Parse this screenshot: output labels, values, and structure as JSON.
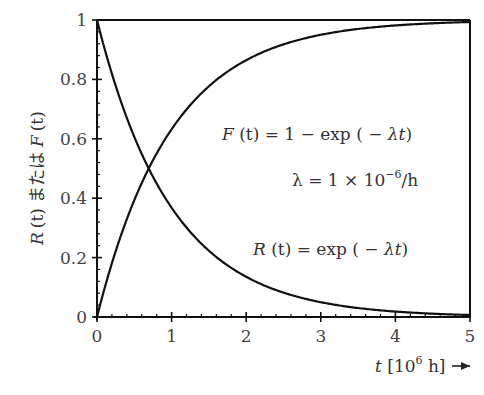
{
  "chart_data": {
    "type": "line",
    "title": "",
    "xlabel": "t [10^6 h] →",
    "xlabel_parts": {
      "var": "t",
      "open": " [10",
      "sup": "6",
      "close": " h]"
    },
    "ylabel": "R (t) または F (t)",
    "ylabel_parts": {
      "r": "R",
      "t1": "(t)",
      "mid": "または",
      "f": "F",
      "t2": "(t)"
    },
    "xlim": [
      0,
      5
    ],
    "ylim": [
      0,
      1
    ],
    "x_ticks": [
      "0",
      "1",
      "2",
      "3",
      "4",
      "5"
    ],
    "y_ticks": [
      "0",
      "0.2",
      "0.4",
      "0.6",
      "0.8",
      "1"
    ],
    "grid": false,
    "lambda_per_1e6h": 1,
    "series": [
      {
        "name": "F(t) = 1 − exp(−λt)",
        "x": [
          0,
          0.5,
          0.693,
          1,
          1.5,
          2,
          2.5,
          3,
          3.5,
          4,
          4.5,
          5
        ],
        "values": [
          0,
          0.393,
          0.5,
          0.632,
          0.777,
          0.865,
          0.918,
          0.95,
          0.97,
          0.982,
          0.989,
          0.993
        ]
      },
      {
        "name": "R(t) = exp(−λt)",
        "x": [
          0,
          0.5,
          0.693,
          1,
          1.5,
          2,
          2.5,
          3,
          3.5,
          4,
          4.5,
          5
        ],
        "values": [
          1,
          0.607,
          0.5,
          0.368,
          0.223,
          0.135,
          0.082,
          0.05,
          0.03,
          0.018,
          0.011,
          0.007
        ]
      }
    ],
    "annotations": [
      {
        "id": "F",
        "text": "F (t) = 1 − exp ( − λt)"
      },
      {
        "id": "lambda",
        "text": "λ = 1 × 10^−6/h"
      },
      {
        "id": "R",
        "text": "R (t) = exp ( − λt)"
      }
    ]
  },
  "annotations": {
    "f_lhs": "F",
    "f_t": " (t) = 1 − exp ( − ",
    "f_lt": "λt",
    "f_close": ")",
    "lam": "λ",
    "lam_rest": " = 1 × 10",
    "lam_sup": "−6",
    "lam_unit": "/h",
    "r_lhs": "R",
    "r_t": " (t) = exp ( − ",
    "r_lt": "λt",
    "r_close": ")"
  }
}
